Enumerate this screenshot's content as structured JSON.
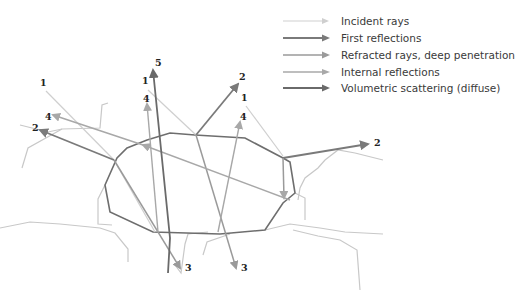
{
  "legend": {
    "items": [
      {
        "label": "Incident rays",
        "color": "#cfcfcf",
        "width": 1.2
      },
      {
        "label": "First reflections",
        "color": "#7a7a7a",
        "width": 2
      },
      {
        "label": "Refracted rays, deep penetration",
        "color": "#9a9a9a",
        "width": 1.6
      },
      {
        "label": "Internal reflections",
        "color": "#a8a8a8",
        "width": 1.4
      },
      {
        "label": "Volumetric scattering (diffuse)",
        "color": "#6a6a6a",
        "width": 2
      }
    ]
  },
  "ray_labels": [
    {
      "text": "1",
      "x": 40,
      "y": 86
    },
    {
      "text": "1",
      "x": 142,
      "y": 84
    },
    {
      "text": "1",
      "x": 241,
      "y": 101
    },
    {
      "text": "2",
      "x": 32,
      "y": 131
    },
    {
      "text": "2",
      "x": 239,
      "y": 80
    },
    {
      "text": "2",
      "x": 374,
      "y": 146
    },
    {
      "text": "3",
      "x": 185,
      "y": 271
    },
    {
      "text": "3",
      "x": 241,
      "y": 271
    },
    {
      "text": "4",
      "x": 45,
      "y": 120
    },
    {
      "text": "4",
      "x": 143,
      "y": 102
    },
    {
      "text": "4",
      "x": 240,
      "y": 120
    },
    {
      "text": "5",
      "x": 155,
      "y": 66
    }
  ],
  "colors": {
    "crystal_outline": "#6e6e6e",
    "neighbor_outline": "#c8c8c8",
    "background": "#ffffff"
  }
}
